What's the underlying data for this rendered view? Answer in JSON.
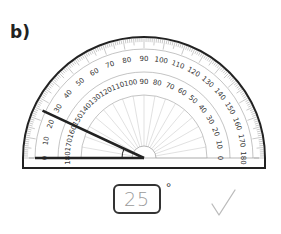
{
  "question": {
    "label": "b)"
  },
  "protractor": {
    "outer_scale": [
      "0",
      "10",
      "20",
      "30",
      "40",
      "50",
      "60",
      "70",
      "80",
      "90",
      "100",
      "110",
      "120",
      "130",
      "140",
      "150",
      "160",
      "170",
      "180"
    ],
    "inner_scale": [
      "180",
      "170",
      "160",
      "150",
      "140",
      "130",
      "120",
      "110",
      "100",
      "90",
      "80",
      "70",
      "60",
      "50",
      "40",
      "30",
      "20",
      "10",
      "0"
    ],
    "angle_arms": {
      "baseline_angle_deg": 0,
      "ray_angle_deg": 25
    }
  },
  "answer": {
    "value": "25",
    "unit": "°",
    "mark": "✓"
  },
  "colors": {
    "line": "#222222",
    "scale": "#888888",
    "answer_text": "#9a9a9a",
    "check": "#bbbbbb"
  }
}
